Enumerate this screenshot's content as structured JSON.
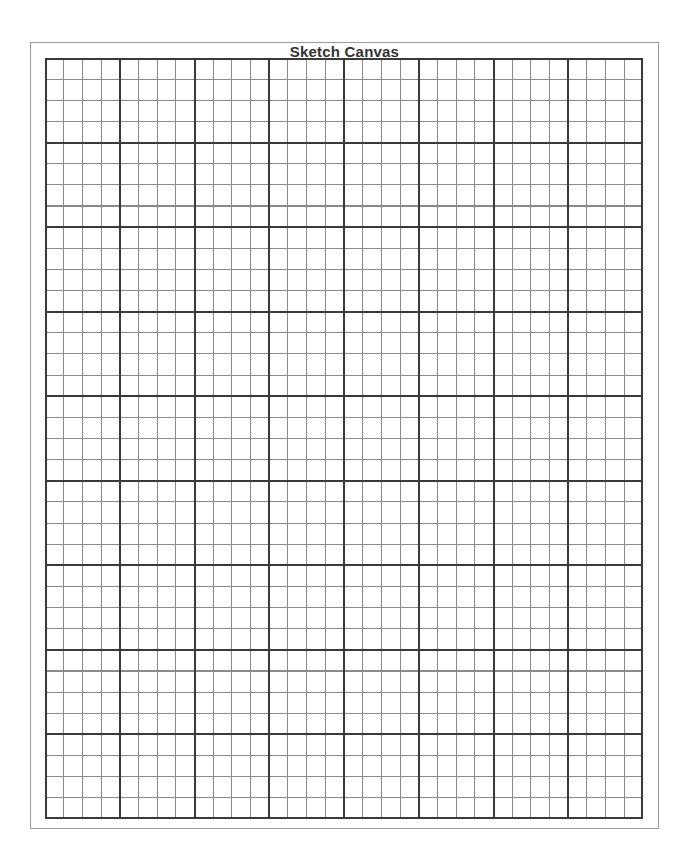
{
  "canvas": {
    "title": "Sketch Canvas",
    "grid": {
      "columns": 32,
      "rows": 36,
      "cells_per_major_block_x": 4,
      "cells_per_major_block_y": 4,
      "major_line_color": "#3a3a3a",
      "minor_line_color": "#8a8a8a",
      "frame_color": "#9a9a9a",
      "background_color": "#ffffff"
    }
  }
}
